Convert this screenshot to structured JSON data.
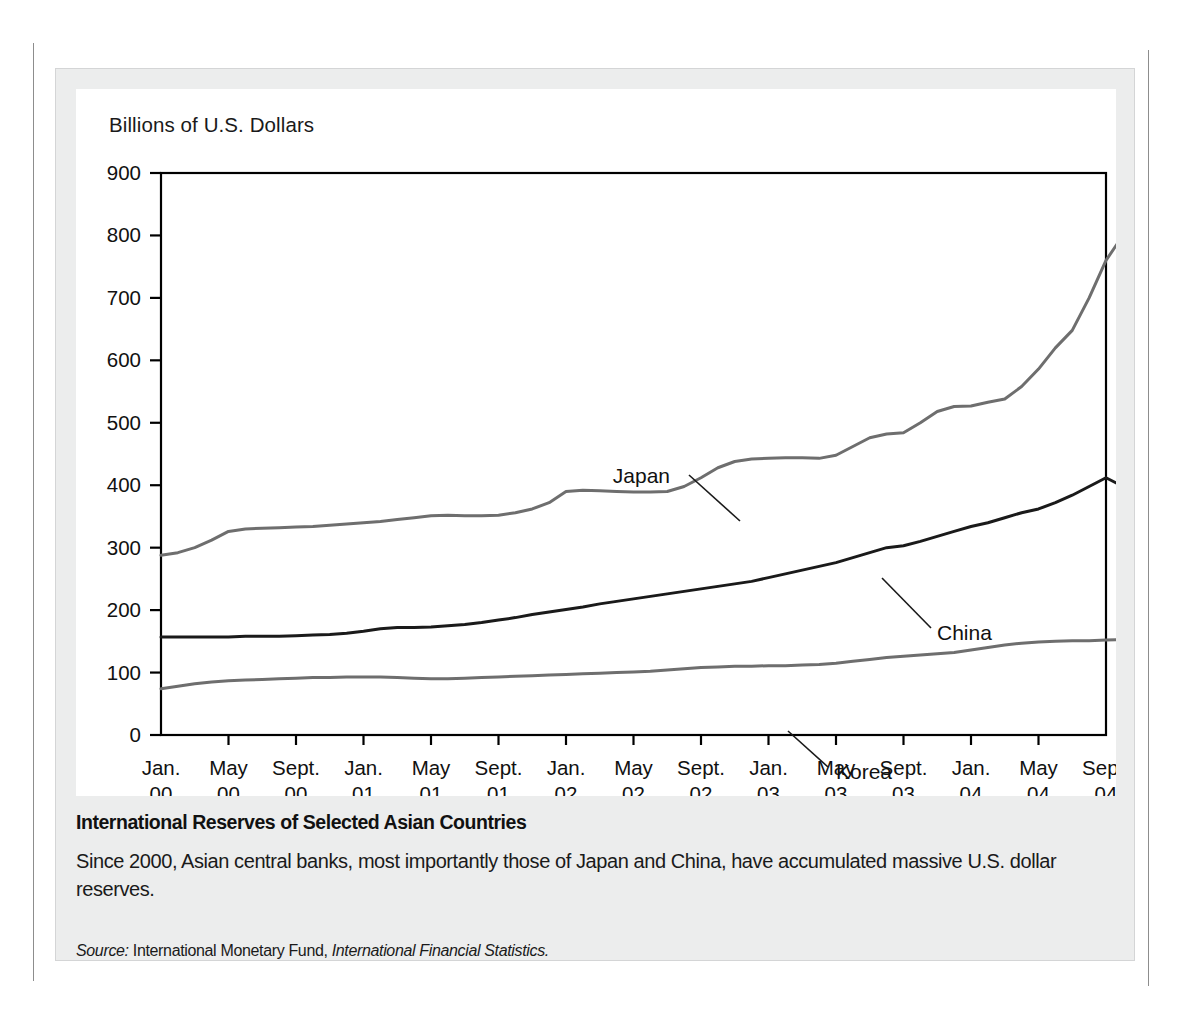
{
  "figure": {
    "axis_unit_label": "Billions of U.S. Dollars",
    "caption_title": "International Reserves of Selected Asian Countries",
    "caption_body": "Since 2000, Asian central banks, most importantly those of Japan and China, have accumulated massive U.S. dollar reserves.",
    "source_prefix": "Source:",
    "source_org": "International Monetary Fund,",
    "source_publication": "International Financial Statistics.",
    "colors": {
      "japan_line": "#6e6e6e",
      "korea_line": "#6e6e6e",
      "china_line": "#1a1a1a",
      "axis": "#000000",
      "panel_background": "#eceded",
      "plot_background": "#ffffff"
    }
  },
  "chart_data": {
    "type": "line",
    "title": "International Reserves of Selected Asian Countries",
    "xlabel": "",
    "ylabel": "Billions of U.S. Dollars",
    "ylim": [
      0,
      900
    ],
    "yticks": [
      0,
      100,
      200,
      300,
      400,
      500,
      600,
      700,
      800,
      900
    ],
    "ytick_labels": [
      "0",
      "100",
      "200",
      "300",
      "400",
      "500",
      "600",
      "700",
      "800",
      "900"
    ],
    "grid": false,
    "legend": "inline-labels",
    "xtick_labels": [
      {
        "month": "Jan.",
        "year": "00"
      },
      {
        "month": "May",
        "year": "00"
      },
      {
        "month": "Sept.",
        "year": "00"
      },
      {
        "month": "Jan.",
        "year": "01"
      },
      {
        "month": "May",
        "year": "01"
      },
      {
        "month": "Sept.",
        "year": "01"
      },
      {
        "month": "Jan.",
        "year": "02"
      },
      {
        "month": "May",
        "year": "02"
      },
      {
        "month": "Sept.",
        "year": "02"
      },
      {
        "month": "Jan.",
        "year": "03"
      },
      {
        "month": "May",
        "year": "03"
      },
      {
        "month": "Sept.",
        "year": "03"
      },
      {
        "month": "Jan.",
        "year": "04"
      },
      {
        "month": "May",
        "year": "04"
      },
      {
        "month": "Sept.",
        "year": "04"
      }
    ],
    "x_start": "2000-01",
    "x_end": "2004-09",
    "x_index_count": 57,
    "series": [
      {
        "name": "Japan",
        "color": "#6e6e6e",
        "label_position": {
          "x": 594,
          "y": 394
        },
        "leader_line": {
          "x1": 613,
          "y1": 386,
          "x2": 664,
          "y2": 432
        },
        "values": [
          288,
          292,
          300,
          312,
          326,
          330,
          331,
          332,
          333,
          334,
          336,
          338,
          340,
          342,
          345,
          348,
          351,
          352,
          351,
          351,
          352,
          356,
          362,
          372,
          390,
          392,
          391,
          390,
          389,
          389,
          390,
          398,
          412,
          428,
          438,
          442,
          443,
          444,
          444,
          443,
          448,
          462,
          476,
          482,
          484,
          500,
          518,
          526,
          527,
          533,
          538,
          558,
          586,
          620,
          648,
          700,
          760,
          800,
          805,
          793,
          795,
          800,
          806,
          810,
          813,
          815
        ]
      },
      {
        "name": "China",
        "color": "#1a1a1a",
        "label_position": {
          "x": 861,
          "y": 551
        },
        "leader_line": {
          "x1": 855,
          "y1": 539,
          "x2": 806,
          "y2": 489
        },
        "values": [
          157,
          157,
          157,
          157,
          157,
          158,
          158,
          158,
          159,
          160,
          161,
          163,
          166,
          170,
          172,
          172,
          173,
          175,
          177,
          180,
          184,
          188,
          193,
          197,
          201,
          205,
          210,
          214,
          218,
          222,
          226,
          230,
          234,
          238,
          242,
          246,
          252,
          258,
          264,
          270,
          276,
          284,
          292,
          300,
          303,
          310,
          318,
          326,
          334,
          340,
          348,
          356,
          362,
          372,
          384,
          398,
          412,
          398,
          404,
          414,
          424,
          432,
          440,
          452,
          468,
          486,
          500,
          516,
          534,
          548,
          563
        ]
      },
      {
        "name": "Korea",
        "color": "#6e6e6e",
        "label_position": {
          "x": 760,
          "y": 690
        },
        "leader_line": {
          "x1": 752,
          "y1": 678,
          "x2": 712,
          "y2": 642
        },
        "values": [
          74,
          78,
          82,
          85,
          87,
          88,
          89,
          90,
          91,
          92,
          92,
          93,
          93,
          93,
          92,
          91,
          90,
          90,
          91,
          92,
          93,
          94,
          95,
          96,
          97,
          98,
          99,
          100,
          101,
          102,
          104,
          106,
          108,
          109,
          110,
          110,
          111,
          111,
          112,
          113,
          115,
          118,
          121,
          124,
          126,
          128,
          130,
          132,
          136,
          140,
          144,
          147,
          149,
          150,
          151,
          151,
          152,
          153,
          155,
          157,
          159,
          161,
          163,
          166,
          170,
          175
        ]
      }
    ]
  }
}
